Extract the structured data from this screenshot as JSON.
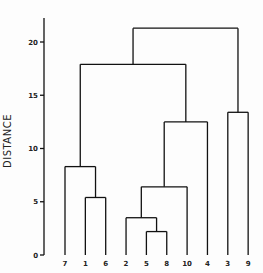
{
  "chart_data": {
    "type": "dendrogram",
    "title": "",
    "xlabel": "",
    "ylabel": "DISTANCE",
    "ylim": [
      0,
      23
    ],
    "yticks": [
      0,
      5,
      10,
      15,
      20
    ],
    "grid": false,
    "leaf_order": [
      "7",
      "1",
      "6",
      "2",
      "5",
      "8",
      "10",
      "4",
      "3",
      "9"
    ],
    "merges": [
      {
        "left": "5",
        "right": "8",
        "height": 2.2
      },
      {
        "left": "2",
        "right": "(5,8)",
        "height": 3.5
      },
      {
        "left": "1",
        "right": "6",
        "height": 5.4
      },
      {
        "left": "(2,(5,8))",
        "right": "(10,4)",
        "height": 6.4
      },
      {
        "left": "7",
        "right": "(1,6)",
        "height": 8.3
      },
      {
        "left": "((2,(5,8)),10)",
        "right": "4",
        "height": 12.5
      },
      {
        "left": "3",
        "right": "9",
        "height": 13.4
      },
      {
        "left": "(7,(1,6))",
        "right": "(2,5,8,10,4)",
        "height": 17.9
      },
      {
        "left": "(7,1,6,2,5,8,10,4)",
        "right": "(3,9)",
        "height": 21.3
      }
    ]
  },
  "axis": {
    "ylabel": "DISTANCE",
    "ticks": [
      "0",
      "5",
      "10",
      "15",
      "20"
    ]
  },
  "leaves": [
    "7",
    "1",
    "6",
    "2",
    "5",
    "8",
    "10",
    "4",
    "3",
    "9"
  ]
}
